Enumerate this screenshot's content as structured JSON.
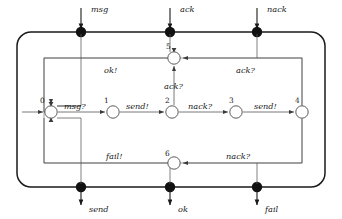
{
  "diagram": {
    "type": "automaton-component-diagram",
    "title": "",
    "outer_box": {
      "x": 17,
      "y": 32,
      "width": 308,
      "height": 155,
      "corner_radius": 14,
      "stroke": "#1a1a1a"
    },
    "inner_box": {
      "x": 44,
      "y": 58,
      "width": 258,
      "height": 105,
      "stroke": "#6e6e6e"
    },
    "ports": {
      "top": [
        {
          "name": "msg",
          "label": "msg",
          "x": 81,
          "y": 32
        },
        {
          "name": "ack",
          "label": "ack",
          "x": 170,
          "y": 32
        },
        {
          "name": "nack",
          "label": "nack",
          "x": 257,
          "y": 32
        }
      ],
      "bottom": [
        {
          "name": "send",
          "label": "send",
          "x": 81,
          "y": 187
        },
        {
          "name": "ok",
          "label": "ok",
          "x": 170,
          "y": 187
        },
        {
          "name": "fail",
          "label": "fail",
          "x": 257,
          "y": 187
        }
      ]
    },
    "states": [
      {
        "id": "0",
        "label": "0",
        "x": 51,
        "y": 112,
        "r": 6.2,
        "initial": true
      },
      {
        "id": "1",
        "label": "1",
        "x": 113,
        "y": 112,
        "r": 6.2,
        "initial": false
      },
      {
        "id": "2",
        "label": "2",
        "x": 172,
        "y": 112,
        "r": 6.2,
        "initial": false
      },
      {
        "id": "3",
        "label": "3",
        "x": 236,
        "y": 112,
        "r": 6.2,
        "initial": false
      },
      {
        "id": "4",
        "label": "4",
        "x": 302,
        "y": 112,
        "r": 6.2,
        "initial": false
      },
      {
        "id": "5",
        "label": "5",
        "x": 174,
        "y": 58,
        "r": 6.2,
        "initial": false
      },
      {
        "id": "6",
        "label": "6",
        "x": 174,
        "y": 163,
        "r": 6.2,
        "initial": false
      }
    ],
    "transitions": [
      {
        "from": "0",
        "to": "1",
        "label": "msg?",
        "label_x": 82,
        "label_y": 108
      },
      {
        "from": "1",
        "to": "2",
        "label": "send!",
        "label_x": 143,
        "label_y": 108
      },
      {
        "from": "2",
        "to": "3",
        "label": "nack?",
        "label_x": 204,
        "label_y": 108
      },
      {
        "from": "3",
        "to": "4",
        "label": "send!",
        "label_x": 269,
        "label_y": 108
      },
      {
        "from": "2",
        "to": "5",
        "label": "ack?",
        "label_x": 177,
        "label_y": 88
      },
      {
        "from": "4",
        "to": "5",
        "label": "ack?",
        "label_x": 249,
        "label_y": 71
      },
      {
        "from": "5",
        "to": "0",
        "label": "ok!",
        "label_x": 112,
        "label_y": 71
      },
      {
        "from": "4",
        "to": "6",
        "label": "nack?",
        "label_x": 240,
        "label_y": 159
      },
      {
        "from": "6",
        "to": "0",
        "label": "fail!",
        "label_x": 114,
        "label_y": 159
      }
    ]
  }
}
